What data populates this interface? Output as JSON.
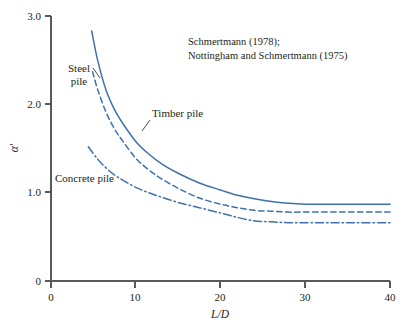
{
  "chart_data": {
    "type": "line",
    "title": "",
    "xlabel": "L/D",
    "ylabel": "α'",
    "xlim": [
      0,
      40
    ],
    "ylim": [
      0,
      3.0
    ],
    "grid": false,
    "legend_position": "inline-annotations",
    "xticks": [
      "0",
      "10",
      "20",
      "30",
      "40"
    ],
    "xtick_values": [
      0,
      10,
      20,
      30,
      40
    ],
    "yticks": [
      "0",
      "1.0",
      "2.0",
      "3.0"
    ],
    "ytick_values": [
      0,
      1.0,
      2.0,
      3.0
    ],
    "annotations": [
      "Schmertmann (1978);",
      "Nottingham and Schmertmann (1975)"
    ],
    "series": [
      {
        "name": "Timber pile",
        "style": "solid",
        "color": "#3f72ab",
        "x": [
          4.8,
          5.5,
          6.5,
          7.5,
          8.5,
          10,
          11.5,
          13,
          15,
          17.5,
          20,
          22,
          24,
          26,
          28,
          30,
          33,
          36,
          40
        ],
        "values": [
          2.83,
          2.5,
          2.16,
          1.94,
          1.78,
          1.58,
          1.44,
          1.33,
          1.22,
          1.11,
          1.03,
          0.97,
          0.93,
          0.9,
          0.88,
          0.87,
          0.87,
          0.87,
          0.87
        ]
      },
      {
        "name": "Steel pile",
        "style": "dashed",
        "color": "#3f72ab",
        "x": [
          4.9,
          5.5,
          6.5,
          7.5,
          8.5,
          10,
          11.5,
          13,
          15,
          17.5,
          20,
          22,
          24,
          26,
          28,
          30,
          33,
          36,
          40
        ],
        "values": [
          2.37,
          2.17,
          1.91,
          1.72,
          1.58,
          1.39,
          1.26,
          1.16,
          1.05,
          0.94,
          0.87,
          0.83,
          0.8,
          0.79,
          0.78,
          0.78,
          0.78,
          0.78,
          0.78
        ]
      },
      {
        "name": "Concrete pile",
        "style": "dashdot",
        "color": "#3f72ab",
        "x": [
          4.4,
          5.5,
          6.5,
          7.5,
          8.5,
          10,
          11.5,
          13,
          15,
          17.5,
          20,
          22,
          24,
          26,
          28,
          30,
          33,
          36,
          40
        ],
        "values": [
          1.52,
          1.38,
          1.28,
          1.2,
          1.14,
          1.06,
          1.0,
          0.95,
          0.89,
          0.83,
          0.77,
          0.72,
          0.68,
          0.67,
          0.66,
          0.66,
          0.66,
          0.66,
          0.66
        ]
      }
    ]
  },
  "labels": {
    "steel_line1": "Steel",
    "steel_line2": "pile",
    "timber": "Timber pile",
    "concrete": "Concrete pile",
    "y_axis": "α'",
    "x_axis": "L/D"
  },
  "colors": {
    "curve": "#3f72ab",
    "axis": "#58595b",
    "text": "#231f20",
    "background": "#ffffff"
  }
}
